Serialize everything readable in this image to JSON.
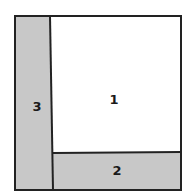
{
  "diagram": {
    "regions": [
      {
        "id": "1",
        "label": "1",
        "fill": "#ffffff"
      },
      {
        "id": "2",
        "label": "2",
        "fill": "#c8c8c8"
      },
      {
        "id": "3",
        "label": "3",
        "fill": "#c8c8c8"
      }
    ],
    "stroke_color": "#222222"
  }
}
